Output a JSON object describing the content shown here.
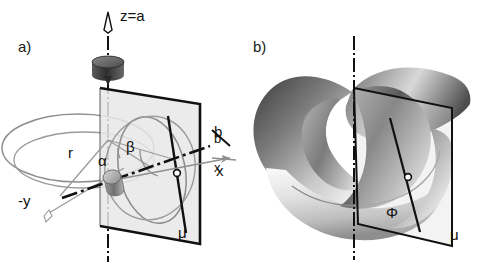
{
  "figure": {
    "background_color": "#ffffff",
    "ink_color": "#111111",
    "gray_curve_color": "#8f8f8f",
    "plane_fill_color": "#e8e8e8",
    "plane_edge_color": "#111111"
  },
  "panels": [
    {
      "id": "a",
      "label": "a)",
      "labels": {
        "axis_z": "z=a",
        "radius": "r",
        "angle_alpha": "α",
        "angle_beta": "β",
        "axis_neg_y": "-y",
        "axis_b": "b",
        "axis_x": "x",
        "plane_mu": "μ"
      }
    },
    {
      "id": "b",
      "label": "b)",
      "labels": {
        "surface_phi": "Φ",
        "plane_mu": "μ",
        "axis_b": "b",
        "axis_x": "x"
      }
    }
  ]
}
